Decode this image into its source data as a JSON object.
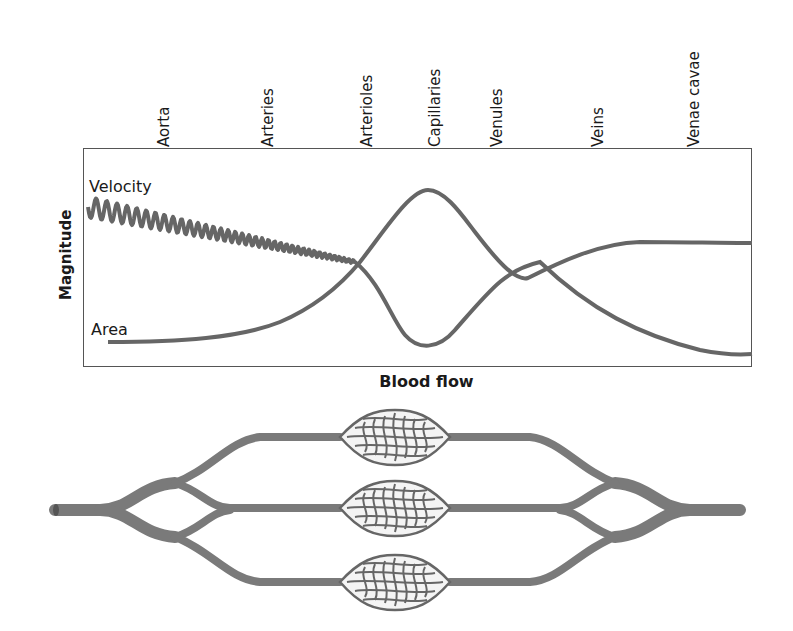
{
  "chart_data": {
    "type": "line",
    "title": "",
    "xlabel": "Blood flow",
    "ylabel": "Magnitude",
    "categories": [
      "Aorta",
      "Arteries",
      "Arterioles",
      "Capillaries",
      "Venules",
      "Veins",
      "Venae cavae"
    ],
    "series": [
      {
        "name": "Velocity",
        "style": "pulsatile (oscillating) in aorta/arteries, smooth afterwards",
        "values": [
          0.85,
          0.72,
          0.42,
          0.05,
          0.25,
          0.08,
          0.03
        ]
      },
      {
        "name": "Area",
        "values": [
          0.04,
          0.12,
          0.42,
          0.97,
          0.62,
          0.52,
          0.52
        ]
      }
    ],
    "grid": false,
    "legend_position": "inline labels at left (Velocity top-left, Area bottom-left)",
    "ylim": [
      0,
      1
    ],
    "annotations": [
      "Category labels are written vertically above the plot frame"
    ]
  },
  "figure": {
    "category_labels": [
      "Aorta",
      "Arteries",
      "Arterioles",
      "Capillaries",
      "Venules",
      "Veins",
      "Venae cavae"
    ],
    "series_labels": {
      "velocity": "Velocity",
      "area": "Area"
    },
    "axis": {
      "x": "Blood flow",
      "y": "Magnitude"
    },
    "diagram": "Illustration of vessel tree: a single vessel branches into arteries, arterioles, three capillary beds, then rejoins through venules and veins",
    "colors": {
      "line": "#666666",
      "frame": "#555555",
      "vessel": "#7a7a7a"
    }
  }
}
